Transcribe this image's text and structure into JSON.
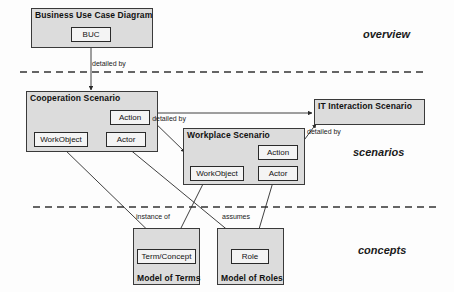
{
  "diagram": {
    "zones": [
      {
        "id": "overview",
        "label": "overview",
        "x": 363,
        "y": 34
      },
      {
        "id": "scenarios",
        "label": "scenarios",
        "x": 353,
        "y": 152
      },
      {
        "id": "concepts",
        "label": "concepts",
        "x": 358,
        "y": 250
      }
    ],
    "containers": [
      {
        "id": "business-use-case-diagram",
        "title": "Business Use Case Diagram",
        "title_position": "top",
        "x": 31,
        "y": 8,
        "w": 122,
        "h": 40,
        "children": [
          {
            "id": "buc",
            "label": "BUC",
            "x": 71,
            "y": 27,
            "w": 40,
            "h": 15
          }
        ]
      },
      {
        "id": "cooperation-scenario",
        "title": "Cooperation Scenario",
        "title_position": "top",
        "x": 26,
        "y": 91,
        "w": 132,
        "h": 61,
        "children": [
          {
            "id": "coop-action",
            "label": "Action",
            "x": 110,
            "y": 110,
            "w": 40,
            "h": 15
          },
          {
            "id": "coop-workobject",
            "label": "WorkObject",
            "x": 34,
            "y": 132,
            "w": 54,
            "h": 15
          },
          {
            "id": "coop-actor",
            "label": "Actor",
            "x": 106,
            "y": 132,
            "w": 40,
            "h": 15
          }
        ]
      },
      {
        "id": "workplace-scenario",
        "title": "Workplace Scenario",
        "title_position": "top",
        "x": 183,
        "y": 128,
        "w": 122,
        "h": 57,
        "children": [
          {
            "id": "work-action",
            "label": "Action",
            "x": 258,
            "y": 145,
            "w": 40,
            "h": 15
          },
          {
            "id": "work-workobject",
            "label": "WorkObject",
            "x": 190,
            "y": 166,
            "w": 54,
            "h": 15
          },
          {
            "id": "work-actor",
            "label": "Actor",
            "x": 258,
            "y": 166,
            "w": 40,
            "h": 15
          }
        ]
      },
      {
        "id": "it-interaction-scenario",
        "title": "IT Interaction Scenario",
        "title_position": "top",
        "x": 314,
        "y": 99,
        "w": 111,
        "h": 26,
        "children": []
      },
      {
        "id": "model-of-terms",
        "title": "Model of Terms",
        "title_position": "bottom",
        "x": 133,
        "y": 228,
        "w": 67,
        "h": 57,
        "children": [
          {
            "id": "term-concept",
            "label": "Term/Concept",
            "x": 137,
            "y": 249,
            "w": 59,
            "h": 15
          }
        ]
      },
      {
        "id": "model-of-roles",
        "title": "Model of Roles",
        "title_position": "bottom",
        "x": 217,
        "y": 228,
        "w": 67,
        "h": 57,
        "children": [
          {
            "id": "role",
            "label": "Role",
            "x": 231,
            "y": 249,
            "w": 38,
            "h": 15
          }
        ]
      }
    ],
    "edge_labels": [
      {
        "id": "buc-detailed-by",
        "text": "detailed by",
        "x": 92,
        "y": 60,
        "style": "single"
      },
      {
        "id": "coop-detailed-by",
        "text": "detailed by",
        "x": 153,
        "y": 115,
        "style": "two-line"
      },
      {
        "id": "workplace-detailed-by",
        "text": "detailed by",
        "x": 308,
        "y": 129,
        "style": "single"
      },
      {
        "id": "instance-of",
        "text": "instance of",
        "x": 136,
        "y": 214,
        "style": "single"
      },
      {
        "id": "assumes",
        "text": "assumes",
        "x": 222,
        "y": 214,
        "style": "single"
      }
    ],
    "separators": [
      {
        "id": "separator-overview-scenarios",
        "y": 72,
        "x1": 20,
        "x2": 426
      },
      {
        "id": "separator-scenarios-concepts",
        "y": 207,
        "x1": 33,
        "x2": 436
      }
    ],
    "connectors": [
      {
        "id": "conn-buc-to-cooperation",
        "from": "buc",
        "to": "cooperation-scenario",
        "x1": 91,
        "y1": 42,
        "x2": 91,
        "y2": 91
      },
      {
        "id": "conn-coop-action-to-workplace",
        "from": "coop-action",
        "to": "workplace-scenario",
        "x1": 150,
        "y1": 117,
        "x2": 186,
        "y2": 152
      },
      {
        "id": "conn-coop-action-to-it",
        "from": "coop-action",
        "to": "it-interaction",
        "x1": 150,
        "y1": 114,
        "x2": 313,
        "y2": 114
      },
      {
        "id": "conn-workplace-action-to-it",
        "from": "work-action",
        "to": "it-interaction",
        "x1": 298,
        "y1": 148,
        "x2": 315,
        "y2": 122
      },
      {
        "id": "conn-coop-workobject-to-term",
        "from": "coop-workobject",
        "to": "term-concept",
        "x1": 63,
        "y1": 147,
        "x2": 165,
        "y2": 247
      },
      {
        "id": "conn-coop-actor-to-role",
        "from": "coop-actor",
        "to": "role",
        "x1": 128,
        "y1": 147,
        "x2": 248,
        "y2": 247
      },
      {
        "id": "conn-work-workobject-to-term",
        "from": "work-workobject",
        "to": "term-concept",
        "x1": 203,
        "y1": 181,
        "x2": 172,
        "y2": 247
      },
      {
        "id": "conn-work-actor-to-role",
        "from": "work-actor",
        "to": "role",
        "x1": 272,
        "y1": 181,
        "x2": 253,
        "y2": 247
      }
    ],
    "colors": {
      "container_fill": "#dcdcdc",
      "element_fill": "#f4f4f4",
      "stroke": "#2a2a2a",
      "background": "#fdfdfd"
    }
  }
}
